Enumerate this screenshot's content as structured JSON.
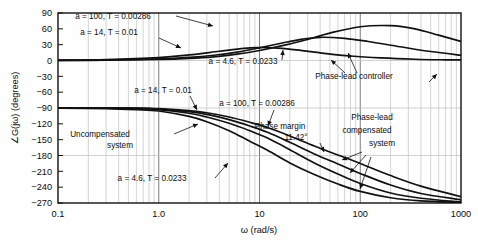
{
  "figure": {
    "background": "#fefefe",
    "frame_color": "#111111",
    "grid_color": "#b9b9b9",
    "curve_color": "#111111"
  },
  "chart_data": {
    "type": "line",
    "title": "",
    "xlabel": "ω (rad/s)",
    "ylabel": "∠G(jω) (degrees)",
    "xscale": "log",
    "xlim": [
      0.1,
      1000
    ],
    "ylim": [
      -270,
      90
    ],
    "xticks": [
      0.1,
      1.0,
      10,
      100,
      1000
    ],
    "xticklabels": [
      "0.1",
      "1.0",
      "10",
      "100",
      "1000"
    ],
    "yticks": [
      90,
      60,
      30,
      0,
      -30,
      -60,
      -90,
      -120,
      -150,
      -180,
      -210,
      -240,
      -270
    ],
    "yticklabels": [
      "90",
      "60",
      "30",
      "0",
      "−30",
      "−60",
      "−90",
      "−120",
      "−150",
      "−180",
      "−210",
      "−240",
      "−270"
    ],
    "grid": true,
    "grid_minor": true,
    "legend": "none",
    "series": [
      {
        "name": "phase-lead controller a = 100, T = 0.00286",
        "group": "controller",
        "a": 100,
        "T": 0.00286,
        "x": [
          0.1,
          0.3,
          1.0,
          2.0,
          3.5,
          6.0,
          10,
          18.7,
          30,
          50,
          100,
          200,
          350,
          600,
          1000
        ],
        "y": [
          0.2,
          0.6,
          2.0,
          4.0,
          7.0,
          12.0,
          19.0,
          30.0,
          40.0,
          52.0,
          64.0,
          66.0,
          60.0,
          48.0,
          36.0
        ]
      },
      {
        "name": "phase-lead controller a = 14, T = 0.01",
        "group": "controller",
        "a": 14,
        "T": 0.01,
        "x": [
          0.1,
          0.3,
          1.0,
          2.0,
          3.5,
          6.0,
          10,
          18.7,
          26.7,
          40,
          70,
          120,
          250,
          500,
          1000
        ],
        "y": [
          0.3,
          0.9,
          3.0,
          6.0,
          10.0,
          16.0,
          24.0,
          35.0,
          40.5,
          44.0,
          42.0,
          36.0,
          26.0,
          17.0,
          10.0
        ]
      },
      {
        "name": "phase-lead controller a = 4.6, T = 0.0233",
        "group": "controller",
        "a": 4.6,
        "T": 0.0233,
        "x": [
          0.1,
          0.3,
          1.0,
          2.0,
          4.0,
          7.0,
          9.25,
          14,
          22,
          40,
          80,
          160,
          350,
          700,
          1000
        ],
        "y": [
          0.6,
          1.8,
          5.5,
          10.5,
          17.5,
          23.0,
          24.5,
          24.0,
          20.5,
          14.5,
          8.5,
          4.8,
          2.4,
          1.3,
          1.0
        ]
      },
      {
        "name": "uncompensated system",
        "group": "system",
        "x": [
          0.1,
          0.3,
          0.6,
          1.0,
          2.0,
          3.0,
          5.0,
          8.0,
          12,
          20,
          35,
          60,
          100,
          200,
          400,
          1000
        ],
        "y": [
          -90.3,
          -91.0,
          -93.0,
          -95.7,
          -106.0,
          -116.0,
          -133.0,
          -153.0,
          -170.0,
          -194.0,
          -216.0,
          -234.0,
          -248.0,
          -260.0,
          -266.0,
          -269.0
        ]
      },
      {
        "name": "phase-lead compensated system a = 4.6, T = 0.0233",
        "group": "compensated",
        "a": 4.6,
        "T": 0.0233,
        "x": [
          0.1,
          0.3,
          0.6,
          1.0,
          2.0,
          3.0,
          5.0,
          8.0,
          12,
          20,
          35,
          60,
          100,
          200,
          400,
          1000
        ],
        "y": [
          -89.8,
          -90.2,
          -91.2,
          -93.0,
          -100.0,
          -107.0,
          -119.0,
          -133.0,
          -147.0,
          -169.0,
          -194.0,
          -215.0,
          -233.0,
          -251.0,
          -261.0,
          -268.0
        ]
      },
      {
        "name": "phase-lead compensated system a = 14, T = 0.01",
        "group": "compensated",
        "a": 14,
        "T": 0.01,
        "x": [
          0.1,
          0.3,
          0.6,
          1.0,
          2.0,
          3.0,
          5.0,
          8.0,
          12,
          20,
          35,
          60,
          100,
          200,
          400,
          1000
        ],
        "y": [
          -89.6,
          -89.8,
          -90.5,
          -92.0,
          -97.0,
          -102.0,
          -112.0,
          -124.0,
          -136.0,
          -155.0,
          -177.0,
          -196.0,
          -214.0,
          -236.0,
          -252.0,
          -264.0
        ]
      },
      {
        "name": "phase-lead compensated system a = 100, T = 0.00286",
        "group": "compensated",
        "a": 100,
        "T": 0.00286,
        "x": [
          0.1,
          0.3,
          0.6,
          1.0,
          2.0,
          3.0,
          5.0,
          8.0,
          12,
          20,
          35,
          60,
          100,
          200,
          400,
          1000
        ],
        "y": [
          -89.5,
          -89.6,
          -90.0,
          -91.2,
          -95.0,
          -99.0,
          -107.0,
          -117.0,
          -127.0,
          -143.0,
          -162.0,
          -179.0,
          -195.0,
          -218.0,
          -238.0,
          -258.0
        ]
      }
    ],
    "annotations": [
      {
        "id": "ann-ctrl-a100",
        "text": "a = 100, T = 0.00286",
        "x_px": 113,
        "y_px": 19
      },
      {
        "id": "ann-ctrl-a14",
        "text": "a = 14, T = 0.01",
        "x_px": 109,
        "y_px": 35
      },
      {
        "id": "ann-ctrl-a46",
        "text": "a = 4.6, T = 0.0233",
        "x_px": 243,
        "y_px": 64
      },
      {
        "id": "ann-phase-lead-controller",
        "text": "Phase-lead controller",
        "x_px": 354,
        "y_px": 79
      },
      {
        "id": "ann-sys-a14",
        "text": "a = 14, T = 0.01",
        "x_px": 163,
        "y_px": 93
      },
      {
        "id": "ann-sys-a100",
        "text": "a = 100, T = 0.00286",
        "x_px": 257,
        "y_px": 106
      },
      {
        "id": "ann-uncompensated",
        "text": "Uncompensated",
        "x_px": 100,
        "y_px": 137
      },
      {
        "id": "ann-uncompensated-2",
        "text": "system",
        "x_px": 120,
        "y_px": 148
      },
      {
        "id": "ann-phase-margin",
        "text": "Phase margin",
        "x_px": 280,
        "y_px": 129
      },
      {
        "id": "ann-phase-margin-value",
        "text": "11.42°",
        "x_px": 296,
        "y_px": 140
      },
      {
        "id": "ann-compensated",
        "text": "Phase-lead",
        "x_px": 372,
        "y_px": 120
      },
      {
        "id": "ann-compensated-2",
        "text": "compensated",
        "x_px": 367,
        "y_px": 133
      },
      {
        "id": "ann-compensated-3",
        "text": "system",
        "x_px": 382,
        "y_px": 146
      },
      {
        "id": "ann-sys-a46",
        "text": "a = 4.6, T = 0.0233",
        "x_px": 152,
        "y_px": 181
      }
    ]
  }
}
